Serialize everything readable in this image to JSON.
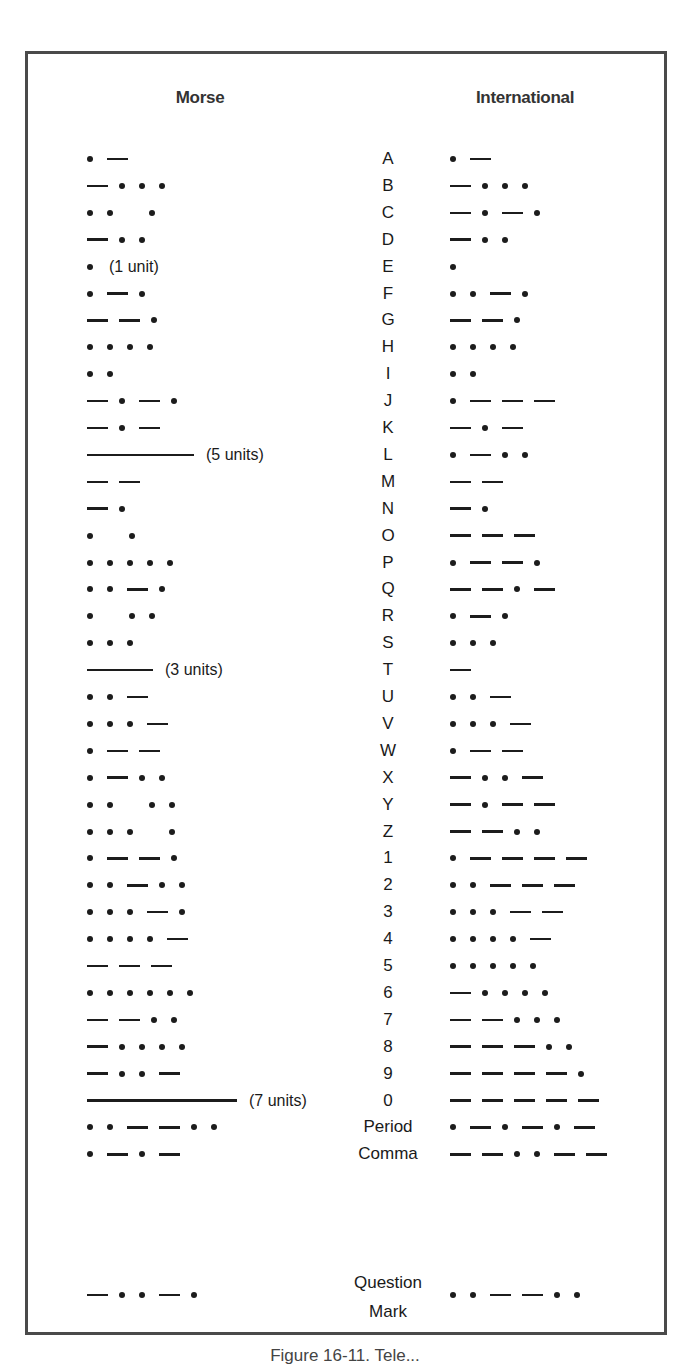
{
  "headers": {
    "morse": "Morse",
    "international": "International"
  },
  "legend": {
    "dot": "dot (•)",
    "dash": "dash (—)",
    "gap": "space within character",
    "long3": "long dash (3 units)",
    "long5": "long dash (5 units)",
    "long7": "long dash (7 units)"
  },
  "rows": [
    {
      "label": "A",
      "morse": ". -",
      "morse_note": "",
      "international": ". -"
    },
    {
      "label": "B",
      "morse": "- . . .",
      "morse_note": "",
      "international": "- . . ."
    },
    {
      "label": "C",
      "morse": ". . _ .",
      "morse_note": "",
      "international": "- . - ."
    },
    {
      "label": "D",
      "morse": "- . .",
      "morse_note": "",
      "international": "- . ."
    },
    {
      "label": "E",
      "morse": ".",
      "morse_note": "(1 unit)",
      "international": "."
    },
    {
      "label": "F",
      "morse": ". - .",
      "morse_note": "",
      "international": ". . - ."
    },
    {
      "label": "G",
      "morse": "- - .",
      "morse_note": "",
      "international": "- - ."
    },
    {
      "label": "H",
      "morse": ". . . .",
      "morse_note": "",
      "international": ". . . ."
    },
    {
      "label": "I",
      "morse": ". .",
      "morse_note": "",
      "international": ". ."
    },
    {
      "label": "J",
      "morse": "- . - .",
      "morse_note": "",
      "international": ". - - -"
    },
    {
      "label": "K",
      "morse": "- . -",
      "morse_note": "",
      "international": "- . -"
    },
    {
      "label": "L",
      "morse": "L5",
      "morse_note": "(5 units)",
      "international": ". - . ."
    },
    {
      "label": "M",
      "morse": "- -",
      "morse_note": "",
      "international": "- -"
    },
    {
      "label": "N",
      "morse": "- .",
      "morse_note": "",
      "international": "- ."
    },
    {
      "label": "O",
      "morse": ". _ .",
      "morse_note": "",
      "international": "- - -"
    },
    {
      "label": "P",
      "morse": ". . . . .",
      "morse_note": "",
      "international": ". - - ."
    },
    {
      "label": "Q",
      "morse": ". . - .",
      "morse_note": "",
      "international": "- - . -"
    },
    {
      "label": "R",
      "morse": ". _ . .",
      "morse_note": "",
      "international": ". - ."
    },
    {
      "label": "S",
      "morse": ". . .",
      "morse_note": "",
      "international": ". . ."
    },
    {
      "label": "T",
      "morse": "L3",
      "morse_note": "(3 units)",
      "international": "-"
    },
    {
      "label": "U",
      "morse": ". . -",
      "morse_note": "",
      "international": ". . -"
    },
    {
      "label": "V",
      "morse": ". . . -",
      "morse_note": "",
      "international": ". . . -"
    },
    {
      "label": "W",
      "morse": ". - -",
      "morse_note": "",
      "international": ". - -"
    },
    {
      "label": "X",
      "morse": ". - . .",
      "morse_note": "",
      "international": "- . . -"
    },
    {
      "label": "Y",
      "morse": ". . _ . .",
      "morse_note": "",
      "international": "- . - -"
    },
    {
      "label": "Z",
      "morse": ". . . _ .",
      "morse_note": "",
      "international": "- - . ."
    },
    {
      "label": "1",
      "morse": ". - - .",
      "morse_note": "",
      "international": ". - - - -"
    },
    {
      "label": "2",
      "morse": ". . - . .",
      "morse_note": "",
      "international": ". . - - -"
    },
    {
      "label": "3",
      "morse": ". . . - .",
      "morse_note": "",
      "international": ". . . - -"
    },
    {
      "label": "4",
      "morse": ". . . . -",
      "morse_note": "",
      "international": ". . . . -"
    },
    {
      "label": "5",
      "morse": "- - -",
      "morse_note": "",
      "international": ". . . . ."
    },
    {
      "label": "6",
      "morse": ". . . . . .",
      "morse_note": "",
      "international": "- . . . ."
    },
    {
      "label": "7",
      "morse": "- - . .",
      "morse_note": "",
      "international": "- - . . ."
    },
    {
      "label": "8",
      "morse": "- . . . .",
      "morse_note": "",
      "international": "- - - . ."
    },
    {
      "label": "9",
      "morse": "- . . -",
      "morse_note": "",
      "international": "- - - - ."
    },
    {
      "label": "0",
      "morse": "L7",
      "morse_note": "(7 units)",
      "international": "- - - - -"
    },
    {
      "label": "Period",
      "morse": ". . - - . .",
      "morse_note": "",
      "international": ". - . - . -"
    },
    {
      "label": "Comma",
      "morse": ". - . -",
      "morse_note": "",
      "international": "- - . . - -"
    },
    {
      "label": "Question Mark",
      "label_lines": [
        "Question",
        "Mark"
      ],
      "morse": "- . . - .",
      "morse_note": "",
      "international": ". . - - . ."
    }
  ],
  "caption": "Figure 16-11. Tele..."
}
